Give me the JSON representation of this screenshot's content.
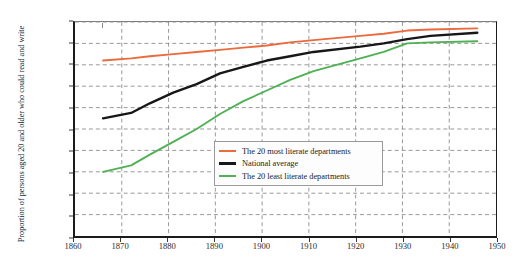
{
  "axes": {
    "ylabel": "Proportion of persons aged 20 and older who could read and write",
    "yticks": [
      "0%",
      "10%",
      "20%",
      "30%",
      "40%",
      "50%",
      "60%",
      "70%",
      "80%",
      "90%",
      "100%"
    ],
    "xticks": [
      "1860",
      "1870",
      "1880",
      "1890",
      "1900",
      "1910",
      "1920",
      "1930",
      "1940",
      "1950"
    ]
  },
  "legend": {
    "items": [
      {
        "label": "The 20 most literate departments",
        "color": "#EC6A3C",
        "name": "legend-item-most-literate"
      },
      {
        "label": "National average",
        "color": "#171717",
        "name": "legend-item-national-average"
      },
      {
        "label": "The 20 least literate departments",
        "color": "#4FB153",
        "name": "legend-item-least-literate"
      }
    ]
  },
  "chart_data": {
    "type": "line",
    "title": "",
    "xlabel": "",
    "ylabel": "Proportion of persons aged 20 and older who could read and write",
    "xlim": [
      1860,
      1950
    ],
    "ylim": [
      0,
      100
    ],
    "xticks": [
      1860,
      1870,
      1880,
      1890,
      1900,
      1910,
      1920,
      1930,
      1940,
      1950
    ],
    "yticks": [
      0,
      10,
      20,
      30,
      40,
      50,
      60,
      70,
      80,
      90,
      100
    ],
    "grid": true,
    "grid_style": "dashed",
    "legend_position": "center",
    "yunit": "percent",
    "series": [
      {
        "name": "The 20 most literate departments",
        "color": "#EC6A3C",
        "x": [
          1866,
          1872,
          1876,
          1881,
          1886,
          1891,
          1896,
          1901,
          1906,
          1911,
          1921,
          1926,
          1931,
          1936,
          1946
        ],
        "values": [
          82,
          83,
          84,
          85,
          86,
          87,
          88,
          89,
          90.5,
          91.5,
          93.5,
          94.5,
          96,
          96.5,
          97
        ]
      },
      {
        "name": "National average",
        "color": "#171717",
        "x": [
          1866,
          1872,
          1876,
          1881,
          1886,
          1891,
          1896,
          1901,
          1906,
          1911,
          1921,
          1926,
          1931,
          1936,
          1946
        ],
        "values": [
          55,
          57.5,
          62,
          67,
          71,
          76,
          79,
          82,
          84,
          86,
          88.5,
          90,
          92,
          93.5,
          95
        ]
      },
      {
        "name": "The 20 least literate departments",
        "color": "#4FB153",
        "x": [
          1866,
          1872,
          1876,
          1881,
          1886,
          1891,
          1896,
          1901,
          1906,
          1911,
          1921,
          1926,
          1931,
          1936,
          1946
        ],
        "values": [
          30,
          33,
          38,
          44,
          50,
          57,
          63,
          68,
          73,
          77,
          83,
          86,
          90,
          90.5,
          91
        ]
      }
    ]
  }
}
